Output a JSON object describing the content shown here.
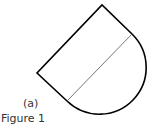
{
  "figure": {
    "sublabel": "(a)",
    "caption": "Figure 1"
  },
  "shape": {
    "description": "Rectangle rotated 45 degrees joined with a semicircle along its diagonal edge",
    "stroke_color": "#000000",
    "divider_color": "#666666"
  }
}
